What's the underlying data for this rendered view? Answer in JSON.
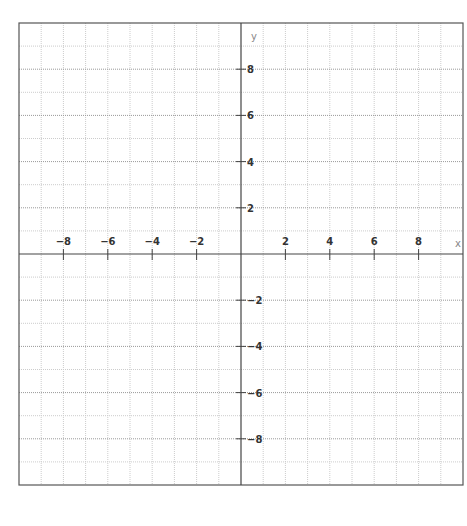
{
  "chart_data": {
    "type": "scatter",
    "title": "",
    "xlabel": "x",
    "ylabel": "y",
    "xlim": [
      -10,
      10
    ],
    "ylim": [
      -10,
      10
    ],
    "grid": true,
    "grid_step": 1,
    "x_ticks": [
      -8,
      -6,
      -4,
      -2,
      2,
      4,
      6,
      8
    ],
    "y_ticks": [
      8,
      6,
      4,
      2,
      -2,
      -4,
      -6,
      -8
    ],
    "x_tick_labels": [
      "−8",
      "−6",
      "−4",
      "−2",
      "2",
      "4",
      "6",
      "8"
    ],
    "y_tick_labels": [
      "8",
      "6",
      "4",
      "2",
      "−2",
      "−4",
      "−6",
      "−8"
    ],
    "series": [],
    "legend": null
  },
  "layout": {
    "frame": {
      "left": 19,
      "top": 23,
      "right": 463,
      "bottom": 485
    },
    "colors": {
      "frame": "#555555",
      "axis": "#444444",
      "grid_major": "#999999",
      "grid_minor": "#cccccc",
      "text": "#333333"
    }
  }
}
